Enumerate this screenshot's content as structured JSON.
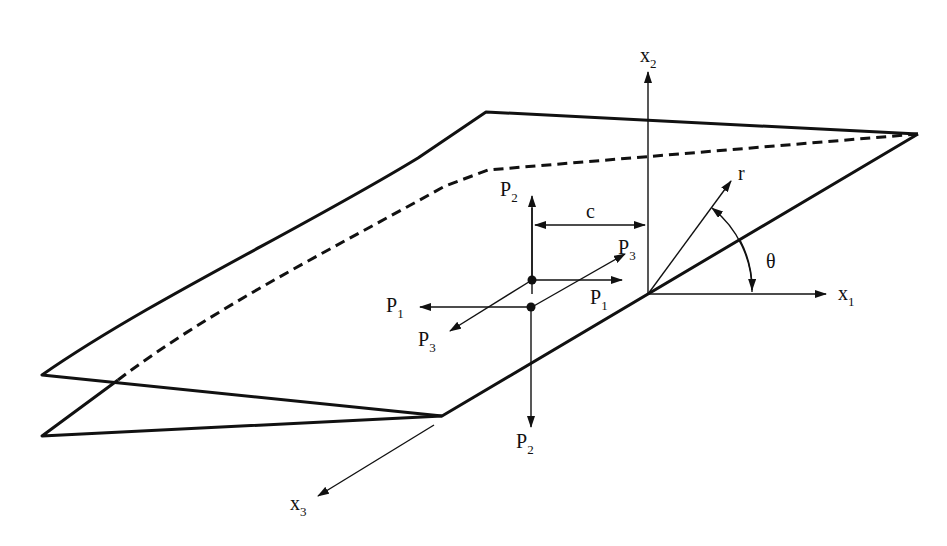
{
  "figure": {
    "background": "#ffffff",
    "ink": "#111111"
  },
  "axes": {
    "x1": {
      "label": "x",
      "subscript": "1"
    },
    "x2": {
      "label": "x",
      "subscript": "2"
    },
    "x3": {
      "label": "x",
      "subscript": "3"
    }
  },
  "polar": {
    "r_label": "r",
    "theta_label": "θ"
  },
  "dimension": {
    "c_label": "c"
  },
  "loads": [
    {
      "id": "P2_top",
      "label": "P",
      "subscript": "2"
    },
    {
      "id": "P3_right",
      "label": "P",
      "subscript": "3"
    },
    {
      "id": "P1_right",
      "label": "P",
      "subscript": "1"
    },
    {
      "id": "P1_left",
      "label": "P",
      "subscript": "1"
    },
    {
      "id": "P3_left",
      "label": "P",
      "subscript": "3"
    },
    {
      "id": "P2_bottom",
      "label": "P",
      "subscript": "2"
    }
  ]
}
